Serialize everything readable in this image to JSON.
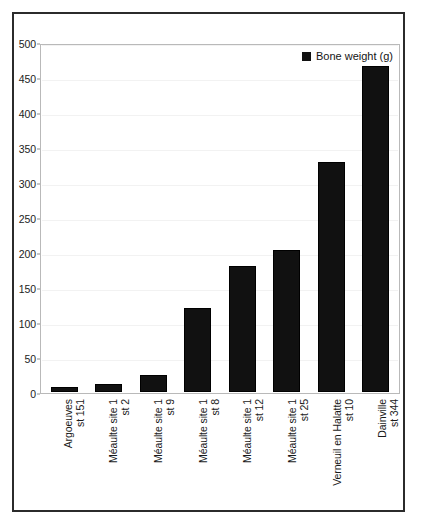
{
  "chart_data": {
    "type": "bar",
    "title": "",
    "xlabel": "",
    "ylabel": "",
    "ylim": [
      0,
      500
    ],
    "ytick_step": 50,
    "grid": true,
    "legend_position": "top-right",
    "series_name": "Bone weight (g)",
    "bar_color": "#111111",
    "categories": [
      "Argoeuves st 151",
      "Méaulte site 1 st 2",
      "Méaulte site 1 st 9",
      "Méaulte site 1 st 8",
      "Méaulte site 1 st 12",
      "Méaulte site 1 st 25",
      "Verneuil en Halatte st 10",
      "Dainville st 344"
    ],
    "category_lines": [
      [
        "Argoeuves",
        "st 151"
      ],
      [
        "Méaulte site 1",
        "st 2"
      ],
      [
        "Méaulte site 1",
        "st 9"
      ],
      [
        "Méaulte site 1",
        "st 8"
      ],
      [
        "Méaulte site 1",
        "st 12"
      ],
      [
        "Méaulte site 1",
        "st 25"
      ],
      [
        "Verneuil en Halatte",
        "st 10"
      ],
      [
        "Dainville",
        "st 344"
      ]
    ],
    "values": [
      7,
      11,
      24,
      120,
      180,
      203,
      328,
      466
    ],
    "yticks": [
      500,
      450,
      400,
      350,
      300,
      250,
      200,
      150,
      100,
      50,
      0
    ],
    "ytick_labels": [
      "500",
      "450",
      "400",
      "350",
      "300",
      "250",
      "200",
      "150",
      "100",
      "50",
      "0"
    ]
  },
  "legend": {
    "label": "Bone weight (g)",
    "swatch_color": "#111111"
  },
  "colors": {
    "frame": "#2b2b2b",
    "plot_border": "#b9b9b9",
    "gridline": "#f2f2f2",
    "background": "#ffffff",
    "text": "#1c1c1c"
  }
}
